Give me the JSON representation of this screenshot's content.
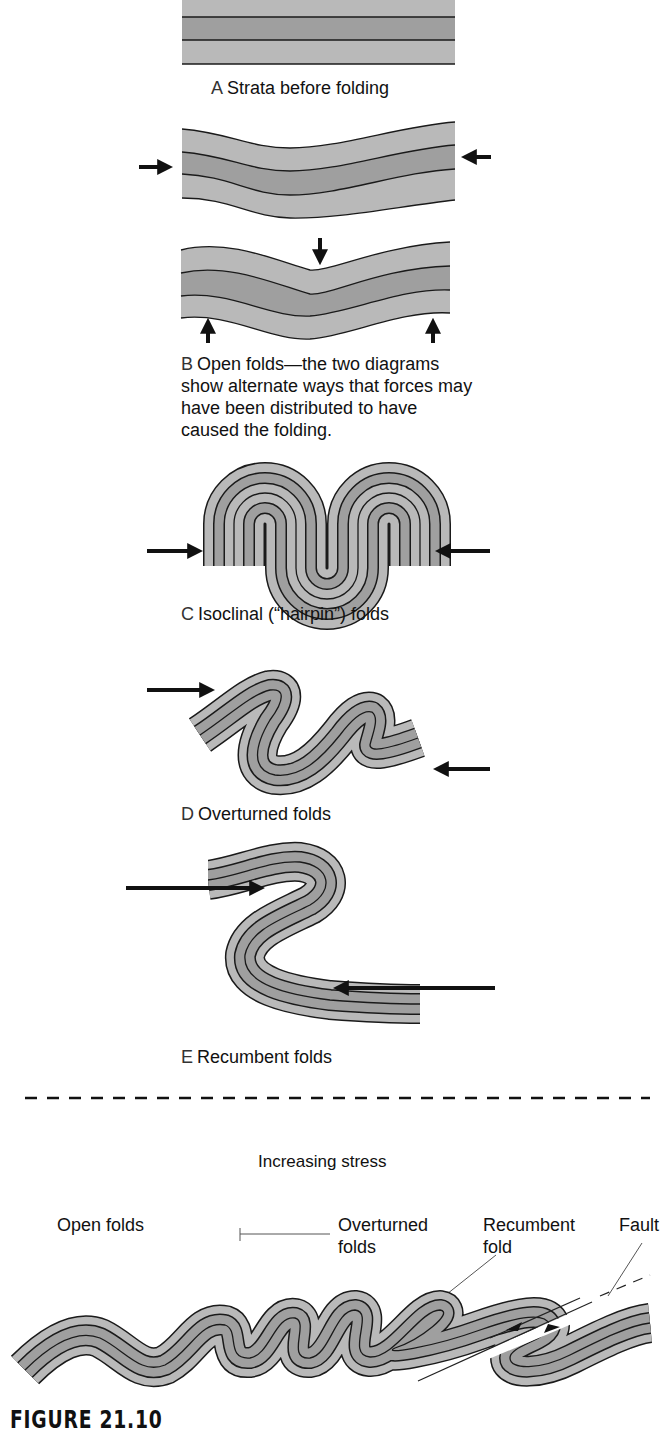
{
  "colors": {
    "light_layer": "#b9b9b9",
    "dark_layer": "#9f9f9f",
    "line": "#1a1a1a",
    "arrow": "#111111"
  },
  "panels": [
    {
      "letter": "A",
      "caption": "Strata before folding"
    },
    {
      "letter": "B",
      "caption": "Open folds—the two diagrams show alternate ways that forces may have been distributed to have caused the folding.",
      "caption_lines": [
        "Open folds—the two diagrams",
        "show alternate ways that forces may",
        "have been distributed to have",
        "caused the folding."
      ]
    },
    {
      "letter": "C",
      "caption": "Isoclinal (“hairpin”) folds"
    },
    {
      "letter": "D",
      "caption": "Overturned folds"
    },
    {
      "letter": "E",
      "caption": "Recumbent folds"
    }
  ],
  "summary": {
    "title": "Increasing stress",
    "labels": {
      "open": "Open folds",
      "overturned_1": "Overturned",
      "overturned_2": "folds",
      "recumbent_1": "Recumbent",
      "recumbent_2": "fold",
      "fault": "Fault"
    }
  },
  "figure_number": "FIGURE 21.10"
}
